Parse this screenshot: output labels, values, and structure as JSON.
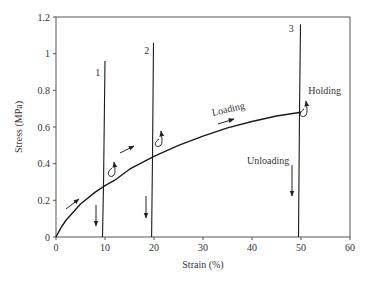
{
  "chart_data": {
    "type": "line",
    "title": "",
    "xlabel": "Strain (%)",
    "ylabel": "Stress (MPa)",
    "xlim": [
      0,
      60
    ],
    "ylim": [
      0,
      1.2
    ],
    "xticks": [
      0,
      10,
      20,
      30,
      40,
      50,
      60
    ],
    "xtick_labels": [
      "0",
      "10",
      "20",
      "30",
      "40",
      "50",
      "60"
    ],
    "yticks": [
      0,
      0.2,
      0.4,
      0.6,
      0.8,
      1.0,
      1.2
    ],
    "ytick_labels": [
      "0",
      "0.2",
      "0.4",
      "0.6",
      "0.8",
      "1",
      "1.2"
    ],
    "grid": false,
    "legend": null,
    "series": [
      {
        "name": "Loading curve",
        "x": [
          0,
          1,
          2,
          5,
          8,
          10,
          12,
          15,
          20,
          25,
          30,
          35,
          40,
          45,
          50
        ],
        "y": [
          0,
          0.05,
          0.09,
          0.18,
          0.245,
          0.28,
          0.31,
          0.37,
          0.44,
          0.5,
          0.55,
          0.595,
          0.63,
          0.66,
          0.68
        ]
      },
      {
        "name": "Relaxation line 1",
        "x": [
          9.5,
          9.7,
          10.0
        ],
        "y": [
          0,
          0.28,
          0.96
        ]
      },
      {
        "name": "Relaxation line 2",
        "x": [
          19.5,
          19.7,
          19.9
        ],
        "y": [
          0,
          0.44,
          1.06
        ]
      },
      {
        "name": "Relaxation line 3",
        "x": [
          49.5,
          49.7,
          49.9
        ],
        "y": [
          0,
          0.68,
          1.16
        ]
      }
    ],
    "annotations": [
      {
        "text": "1",
        "x": 8,
        "y": 0.88
      },
      {
        "text": "2",
        "x": 18,
        "y": 1.0
      },
      {
        "text": "3",
        "x": 47.5,
        "y": 1.12
      },
      {
        "text": "Loading",
        "x": 32,
        "y": 0.66,
        "rotation": -13
      },
      {
        "text": "Holding",
        "x": 51.5,
        "y": 0.78
      },
      {
        "text": "Unloading",
        "x": 39,
        "y": 0.4
      }
    ]
  }
}
